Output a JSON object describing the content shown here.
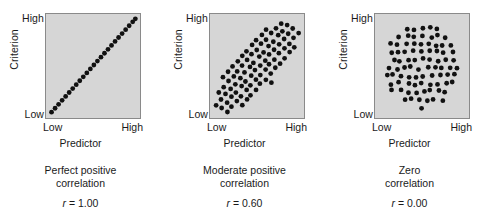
{
  "figure": {
    "background": "#ffffff",
    "plot_fill": "#d6d6d6",
    "plot_border": "#8a8a8a",
    "dot_color": "#111111"
  },
  "axis": {
    "y_title": "Criterion",
    "y_high": "High",
    "y_low": "Low",
    "x_title": "Predictor",
    "x_low": "Low",
    "x_high": "High"
  },
  "panels": [
    {
      "id": "perfect-positive",
      "caption_line1": "Perfect positive",
      "caption_line2": "correlation",
      "r_symbol": "r",
      "r_text": " = 1.00"
    },
    {
      "id": "moderate-positive",
      "caption_line1": "Moderate positive",
      "caption_line2": "correlation",
      "r_symbol": "r",
      "r_text": " = 0.60"
    },
    {
      "id": "zero",
      "caption_line1": "Zero",
      "caption_line2": "correlation",
      "r_symbol": "r",
      "r_text": " = 0.00"
    }
  ],
  "chart_data": [
    {
      "type": "scatter",
      "title": "Perfect positive correlation",
      "r": 1.0,
      "xlabel": "Predictor",
      "ylabel": "Criterion",
      "xlim": [
        0,
        100
      ],
      "ylim": [
        0,
        100
      ],
      "xticklabels": [
        "Low",
        "High"
      ],
      "yticklabels": [
        "Low",
        "High"
      ],
      "grid": false,
      "legend": "none",
      "n_points": 25,
      "points": [
        [
          3,
          3
        ],
        [
          7,
          7
        ],
        [
          11,
          11
        ],
        [
          15,
          15
        ],
        [
          19,
          19
        ],
        [
          23,
          23
        ],
        [
          27,
          27
        ],
        [
          31,
          31
        ],
        [
          35,
          35
        ],
        [
          39,
          39
        ],
        [
          43,
          43
        ],
        [
          47,
          47
        ],
        [
          51,
          51
        ],
        [
          55,
          55
        ],
        [
          59,
          59
        ],
        [
          63,
          63
        ],
        [
          67,
          67
        ],
        [
          71,
          71
        ],
        [
          75,
          75
        ],
        [
          79,
          79
        ],
        [
          83,
          83
        ],
        [
          87,
          87
        ],
        [
          91,
          91
        ],
        [
          95,
          95
        ],
        [
          98,
          98
        ]
      ]
    },
    {
      "type": "scatter",
      "title": "Moderate positive correlation",
      "r": 0.6,
      "xlabel": "Predictor",
      "ylabel": "Criterion",
      "xlim": [
        0,
        100
      ],
      "ylim": [
        0,
        100
      ],
      "xticklabels": [
        "Low",
        "High"
      ],
      "yticklabels": [
        "Low",
        "High"
      ],
      "grid": false,
      "legend": "none",
      "n_points": 136,
      "shape": "ellipse tilted 45 degrees, dense lattice fill",
      "ellipse": {
        "cx": 50,
        "cy": 50,
        "semi_major": 62,
        "semi_minor": 23,
        "angle_deg": 45
      }
    },
    {
      "type": "scatter",
      "title": "Zero correlation",
      "r": 0.0,
      "xlabel": "Predictor",
      "ylabel": "Criterion",
      "xlim": [
        0,
        100
      ],
      "ylim": [
        0,
        100
      ],
      "xticklabels": [
        "Low",
        "High"
      ],
      "yticklabels": [
        "Low",
        "High"
      ],
      "grid": false,
      "legend": "none",
      "n_points": 88,
      "shape": "circular cloud, uniform scatter",
      "circle": {
        "cx": 50,
        "cy": 50,
        "radius": 42
      }
    }
  ]
}
